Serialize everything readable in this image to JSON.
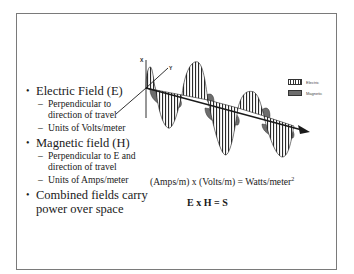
{
  "slide": {
    "bullets": [
      {
        "text": "Electric Field (E)",
        "sub": [
          {
            "line1": "Perpendicular to",
            "line2": "direction of travel"
          },
          {
            "line1": "Units of Volts/meter"
          }
        ]
      },
      {
        "text": "Magnetic field (H)",
        "sub": [
          {
            "line1": "Perpendicular to E and",
            "line2": "direction of travel"
          },
          {
            "line1": "Units of Amps/meter"
          }
        ]
      },
      {
        "text_line1": "Combined fields carry",
        "text_line2": "power over space"
      }
    ],
    "formula_units": "(Amps/m)  x  (Volts/m) = Watts/meter",
    "formula_units_sup": "2",
    "formula_vector": "E x H = S",
    "dash": "–"
  },
  "diagram": {
    "axis_labels": {
      "x": "X",
      "y": "Y"
    },
    "legend": [
      {
        "label": "Electric",
        "pattern": "vertical-hatch"
      },
      {
        "label": "Magnetic",
        "pattern": "solid-gray"
      }
    ],
    "colors": {
      "hatch": "#333333",
      "magnetic_fill": "#6d6d6d",
      "frame": "#7a7a7a"
    }
  }
}
